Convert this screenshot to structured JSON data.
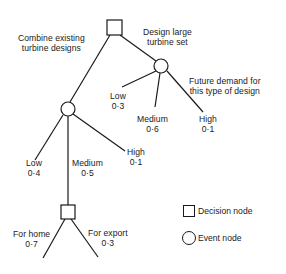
{
  "diagram": {
    "type": "decision-tree",
    "root": {
      "node_type": "decision",
      "options": [
        {
          "label_line1": "Combine existing",
          "label_line2": "turbine designs",
          "event": {
            "node_type": "event",
            "branches": [
              {
                "label": "Low",
                "probability": "0·4"
              },
              {
                "label": "Medium",
                "probability": "0·5",
                "decision": {
                  "node_type": "decision",
                  "branches": [
                    {
                      "label": "For home",
                      "probability": "0·7"
                    },
                    {
                      "label": "For export",
                      "probability": "0·3"
                    }
                  ]
                }
              },
              {
                "label": "High",
                "probability": "0·1"
              }
            ]
          }
        },
        {
          "label_line1": "Design large",
          "label_line2": "turbine set",
          "event": {
            "node_type": "event",
            "caption_line1": "Future demand for",
            "caption_line2": "this type of design",
            "branches": [
              {
                "label": "Low",
                "probability": "0·3"
              },
              {
                "label": "Medium",
                "probability": "0·6"
              },
              {
                "label": "High",
                "probability": "0·1"
              }
            ]
          }
        }
      ]
    }
  },
  "legend": {
    "decision_node": "Decision node",
    "event_node": "Event node"
  },
  "colors": {
    "line": "#1a1a1a",
    "background": "#ffffff"
  }
}
